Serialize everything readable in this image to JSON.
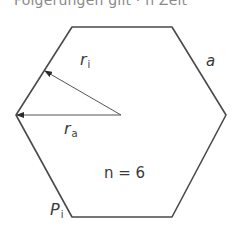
{
  "caption": {
    "text": "Folgerungen gilt · n Zeit"
  },
  "diagram": {
    "shape": "hexagon",
    "stroke_color": "#4a4a4a",
    "vertices": [
      [
        72,
        27
      ],
      [
        172,
        27
      ],
      [
        226,
        115
      ],
      [
        172,
        217
      ],
      [
        72,
        217
      ],
      [
        16,
        115
      ]
    ],
    "center": [
      121,
      115
    ],
    "arrows": [
      {
        "name": "r_i",
        "from": [
          121,
          115
        ],
        "to": [
          44,
          71
        ]
      },
      {
        "name": "r_a",
        "from": [
          121,
          115
        ],
        "to": [
          16,
          115
        ]
      }
    ]
  },
  "labels": {
    "r_i": {
      "main": "r",
      "sub": "i"
    },
    "r_a": {
      "main": "r",
      "sub": "a"
    },
    "side": {
      "main": "a"
    },
    "n": {
      "text": "n = 6"
    },
    "p_i": {
      "main": "P",
      "sub": "i"
    }
  }
}
